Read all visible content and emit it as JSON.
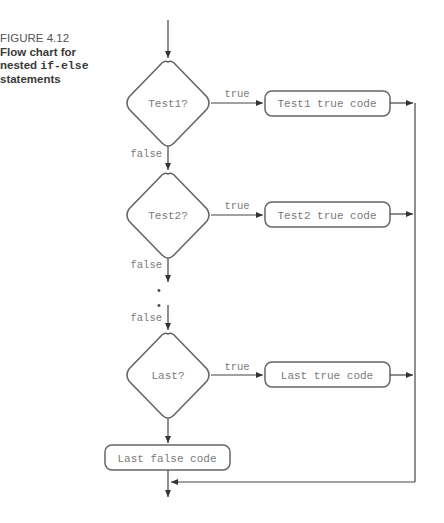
{
  "caption": {
    "figure_number": "FIGURE 4.12",
    "title_line1": "Flow chart for",
    "title_prefix": "nested ",
    "title_code": "if-else",
    "title_line3": "statements"
  },
  "diagram": {
    "decisions": [
      {
        "label": "Test1?",
        "true_label": "true",
        "false_label": "false",
        "true_box": "Test1 true code"
      },
      {
        "label": "Test2?",
        "true_label": "true",
        "false_label": "false",
        "true_box": "Test2 true code"
      },
      {
        "label": "Last?",
        "true_label": "true",
        "false_label": "false",
        "true_box": "Last true code"
      }
    ],
    "ellipsis": "•",
    "final_false_box": "Last false code"
  }
}
